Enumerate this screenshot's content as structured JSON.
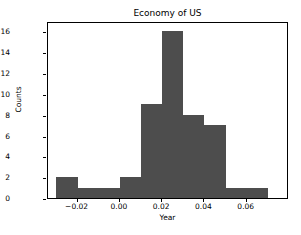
{
  "chart_data": {
    "type": "bar",
    "title": "Economy of US",
    "xlabel": "Year",
    "ylabel": "Counts",
    "grid": false,
    "legend": null,
    "bar_color": "#4d4d4d",
    "xlim": [
      -0.034,
      0.08
    ],
    "ylim": [
      0,
      17
    ],
    "xticks": [
      -0.02,
      0.0,
      0.02,
      0.04,
      0.06
    ],
    "xtick_labels": [
      "−0.02",
      "0.00",
      "0.02",
      "0.04",
      "0.06"
    ],
    "yticks": [
      0,
      2,
      4,
      6,
      8,
      10,
      12,
      14,
      16
    ],
    "ytick_labels": [
      "0",
      "2",
      "4",
      "6",
      "8",
      "10",
      "12",
      "14",
      "16"
    ],
    "bin_width": 0.01,
    "bin_edges": [
      -0.03,
      -0.02,
      -0.01,
      0.0,
      0.01,
      0.02,
      0.03,
      0.04,
      0.05,
      0.06,
      0.07
    ],
    "categories": [
      "-0.03 to -0.02",
      "-0.02 to -0.01",
      "-0.01 to 0.00",
      "0.00 to 0.01",
      "0.01 to 0.02",
      "0.02 to 0.03",
      "0.03 to 0.04",
      "0.04 to 0.05",
      "0.05 to 0.06",
      "0.06 to 0.07"
    ],
    "values": [
      2,
      1,
      1,
      2,
      9,
      16,
      8,
      7,
      1,
      1
    ]
  }
}
